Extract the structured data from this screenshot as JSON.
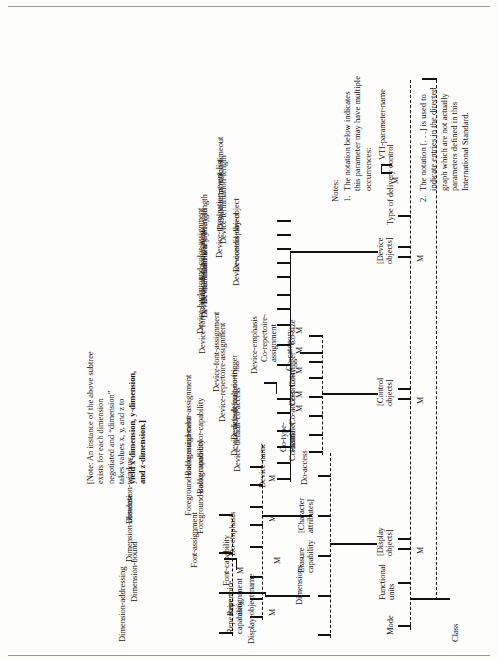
{
  "figure": {
    "orientation": "rotated-90",
    "root_label": "Class",
    "multiplicity_marker": "M"
  },
  "branches": {
    "class_children": [
      {
        "label": "Mode"
      },
      {
        "label": "Functional\nunits"
      },
      {
        "label": "[Display\nobjects]",
        "marker": "M"
      },
      {
        "label": "[Control\nobjects]",
        "marker": "M"
      },
      {
        "label": "[Device\nobjects]",
        "marker": "M"
      },
      {
        "label": "Type of delivery control"
      }
    ]
  },
  "display_objects": {
    "children": [
      {
        "label": "Display-object-name"
      },
      {
        "label": "Dimensions",
        "marker": "M"
      },
      {
        "label": "Erasure\ncapability"
      },
      {
        "label": "[Character\nattributes]"
      },
      {
        "label": "Do-access"
      }
    ],
    "dimensions_children": [
      {
        "label": "Dimension-addressing"
      },
      {
        "label": "Dimension-bound"
      },
      {
        "label": "Dimension-absolute"
      },
      {
        "label": "Dimension-window"
      }
    ],
    "character_attributes_children": [
      {
        "label": "Repertoire\ncapability"
      },
      {
        "label": "Repertoire\nassignment",
        "marker": "M"
      },
      {
        "label": "Font-capability"
      },
      {
        "label": "Font-assignment",
        "marker": "M"
      },
      {
        "label": "Do-emphasis"
      },
      {
        "label": "Foreground-color-capability"
      },
      {
        "label": "Foreground-color-assignment",
        "marker": "M"
      },
      {
        "label": "Background-color-capability"
      },
      {
        "label": "Background-color-assignment",
        "marker": "M"
      }
    ]
  },
  "control_objects": {
    "children": [
      {
        "label": "Co-name"
      },
      {
        "label": "Co-type-\nidentifier"
      },
      {
        "label": "Co-access"
      },
      {
        "label": "Co-priority"
      },
      {
        "label": "Co-trigger"
      },
      {
        "label": "Co-category"
      },
      {
        "label": "Co-repertoire-\nassignment"
      },
      {
        "label": "Co-size"
      }
    ]
  },
  "device_objects": {
    "children": [
      {
        "label": "Device-name"
      },
      {
        "label": "Device-default-co-access"
      },
      {
        "label": "Device-default-co-priority"
      },
      {
        "label": "Device-default-co-trigger"
      },
      {
        "label": "Device-repertoire-assignment",
        "marker": "M"
      },
      {
        "label": "Device-font-assignment",
        "marker": "M"
      },
      {
        "label": "Device-emphasis"
      },
      {
        "label": "Device-foreground-color-assignment",
        "marker": "M"
      },
      {
        "label": "Device-background-color-assignment",
        "marker": "M"
      },
      {
        "label": "Device-minimum-x-array-length"
      },
      {
        "label": "Device-minimum-y-array-length"
      },
      {
        "label": "Device-control-object"
      },
      {
        "label": "Device-display-object"
      },
      {
        "label": "Device-termination-event-list"
      },
      {
        "label": "Device-termination-length"
      },
      {
        "label": "Device-termination-timeout"
      }
    ]
  },
  "dimension_note": {
    "lines_plain": "[Note: An instance of the above subtree\nexists for each dimension\nnegotiated and “dimension”\ntakes values x, y, and z to",
    "lines_bold": "yield x-dimension, y-dimension,\nand z-dimension.]"
  },
  "notes": {
    "heading": "Notes:",
    "items": [
      {
        "number": "1.",
        "text": "The notation below indicates\nthis parameter may have multiple\noccurrences:",
        "example_marker": "M",
        "example_label": "VTI-parameter-name"
      },
      {
        "number": "2.",
        "text": "The notation [. . .] is used to\nindicate entries in the directed\ngraph which are not actually\nparameters defined in this\nInternational Standard."
      }
    ]
  }
}
